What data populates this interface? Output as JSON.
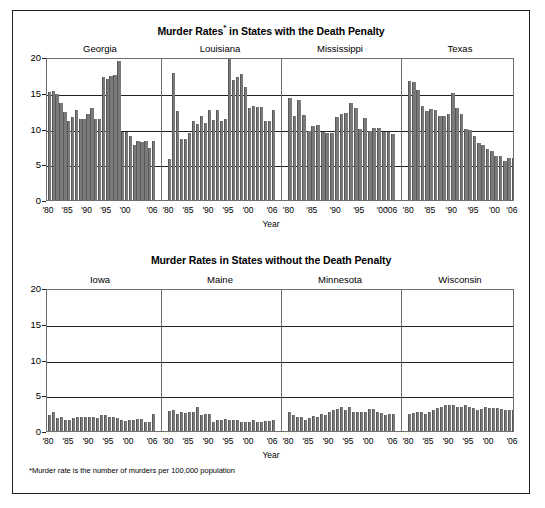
{
  "figure": {
    "footnote": "*Murder rate is the number of murders per 100,000 population",
    "xaxis_title": "Year",
    "bar_color": "#7a7a7d",
    "frame_color": "#231f20"
  },
  "chart_data": [
    {
      "type": "bar",
      "title": "Murder Rates* in States with the Death Penalty",
      "title_main": "Murder Rates",
      "title_sup": "*",
      "title_rest": " in States with the Death Penalty",
      "xlabel": "Year",
      "ylabel": "",
      "ylim": [
        0,
        20
      ],
      "yticks": [
        0,
        5,
        10,
        15,
        20
      ],
      "grid": true,
      "legend": "none",
      "x": [
        1980,
        1981,
        1982,
        1983,
        1984,
        1985,
        1986,
        1987,
        1988,
        1989,
        1990,
        1991,
        1992,
        1993,
        1994,
        1995,
        1996,
        1997,
        1998,
        1999,
        2000,
        2001,
        2002,
        2003,
        2004,
        2005,
        2006
      ],
      "xticklabels": [
        "'80",
        "'85",
        "'90",
        "'95",
        "'00",
        "'06"
      ],
      "panels": [
        {
          "name": "Georgia",
          "values": [
            15.1,
            15.3,
            14.8,
            13.6,
            12.3,
            11.0,
            11.6,
            12.6,
            11.3,
            11.4,
            12.0,
            12.8,
            11.4,
            11.4,
            17.2,
            16.9,
            17.4,
            17.5,
            19.4,
            9.5,
            9.5,
            8.9,
            7.7,
            8.2,
            8.1,
            8.3,
            7.3,
            8.3
          ]
        },
        {
          "name": "Louisiana",
          "values": [
            5.8,
            17.7,
            12.5,
            8.6,
            8.6,
            9.4,
            11.1,
            10.6,
            11.7,
            10.8,
            12.6,
            11.2,
            12.6,
            11.1,
            11.3,
            20.3,
            16.8,
            17.2,
            17.6,
            15.8,
            12.9,
            13.1,
            13.0,
            13.0,
            11.1,
            11.1,
            12.6
          ]
        },
        {
          "name": "Mississippi",
          "values": [
            14.2,
            11.8,
            14.0,
            11.9,
            9.6,
            10.3,
            10.5,
            9.5,
            9.4,
            9.4,
            11.6,
            12.0,
            12.2,
            13.5,
            12.8,
            9.9,
            11.5,
            9.7,
            10.1,
            10.1,
            9.5,
            9.5,
            9.3
          ]
        },
        {
          "name": "Texas",
          "values": [
            16.7,
            16.5,
            15.4,
            13.1,
            12.5,
            12.7,
            12.6,
            11.7,
            11.7,
            12.0,
            15.0,
            12.8,
            12.0,
            10.0,
            9.8,
            9.0,
            8.0,
            7.7,
            7.2,
            6.8,
            6.2,
            6.1,
            5.4,
            5.9,
            5.9
          ]
        }
      ]
    },
    {
      "type": "bar",
      "title": "Murder Rates in States without the Death Penalty",
      "title_main": "Murder Rates in States without the Death Penalty",
      "title_sup": "",
      "title_rest": "",
      "xlabel": "Year",
      "ylabel": "",
      "ylim": [
        0,
        20
      ],
      "yticks": [
        0,
        5,
        10,
        15,
        20
      ],
      "grid": true,
      "legend": "none",
      "x": [
        1980,
        1981,
        1982,
        1983,
        1984,
        1985,
        1986,
        1987,
        1988,
        1989,
        1990,
        1991,
        1992,
        1993,
        1994,
        1995,
        1996,
        1997,
        1998,
        1999,
        2000,
        2001,
        2002,
        2003,
        2004,
        2005,
        2006
      ],
      "xticklabels": [
        "'80",
        "'85",
        "'90",
        "'95",
        "'00",
        "'06"
      ],
      "panels": [
        {
          "name": "Iowa",
          "values": [
            2.2,
            2.6,
            1.8,
            1.9,
            1.5,
            1.6,
            1.8,
            1.9,
            1.9,
            1.9,
            1.9,
            2.0,
            1.8,
            2.2,
            2.2,
            1.9,
            1.9,
            1.8,
            1.6,
            1.4,
            1.6,
            1.6,
            1.7,
            1.7,
            1.3,
            1.3,
            2.4
          ]
        },
        {
          "name": "Maine",
          "values": [
            2.8,
            3.0,
            2.4,
            2.7,
            2.5,
            2.6,
            2.6,
            3.4,
            2.2,
            2.4,
            2.4,
            1.2,
            1.6,
            1.6,
            1.7,
            1.6,
            1.6,
            1.5,
            1.2,
            1.2,
            1.2,
            1.5,
            1.2,
            1.2,
            1.4,
            1.4,
            1.6
          ]
        },
        {
          "name": "Minnesota",
          "values": [
            2.6,
            2.3,
            1.9,
            1.9,
            1.6,
            1.8,
            2.1,
            2.0,
            2.4,
            2.2,
            2.7,
            3.0,
            3.1,
            3.4,
            3.0,
            3.3,
            2.6,
            2.6,
            2.7,
            2.7,
            3.1,
            3.1,
            2.6,
            2.5,
            2.2,
            2.4,
            2.4
          ]
        },
        {
          "name": "Wisconsin",
          "values": [
            2.4,
            2.5,
            2.6,
            2.7,
            2.4,
            2.6,
            2.9,
            3.2,
            3.4,
            3.6,
            3.6,
            3.6,
            3.3,
            3.3,
            3.6,
            3.4,
            3.2,
            3.0,
            3.1,
            3.4,
            3.2,
            3.2,
            3.2,
            3.1,
            3.0,
            3.0,
            3.0
          ]
        }
      ]
    }
  ]
}
